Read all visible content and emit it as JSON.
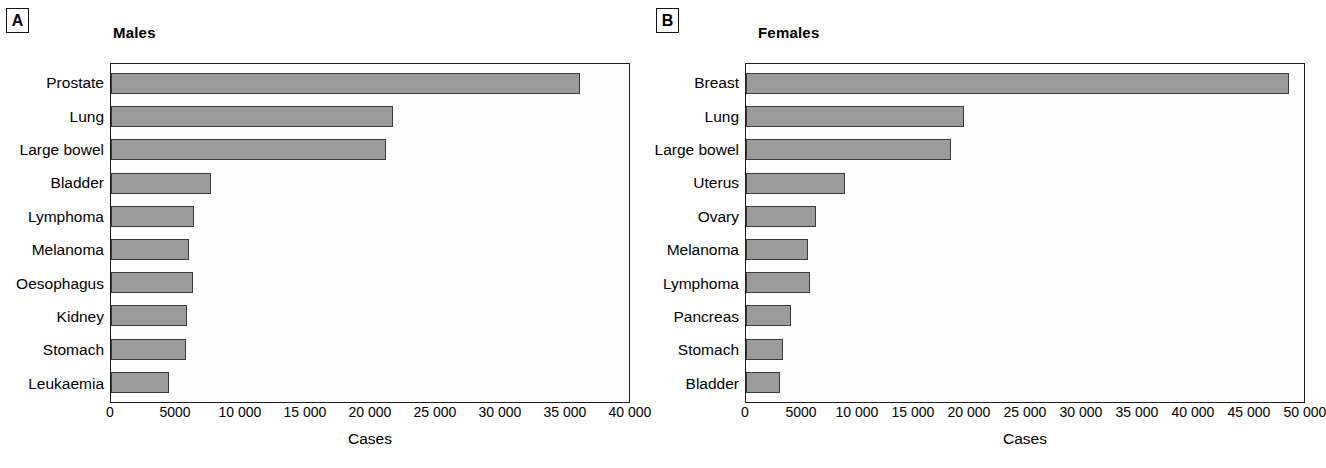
{
  "figure": {
    "panels": [
      {
        "letter": "A",
        "title": "Males",
        "xlabel": "Cases",
        "xticks": [
          "0",
          "5000",
          "10 000",
          "15 000",
          "20 000",
          "25 000",
          "30 000",
          "35 000",
          "40 000"
        ],
        "xmax": 40000
      },
      {
        "letter": "B",
        "title": "Females",
        "xlabel": "Cases",
        "xticks": [
          "0",
          "5000",
          "10 000",
          "15 000",
          "20 000",
          "25 000",
          "30 000",
          "35 000",
          "40 000",
          "45 000",
          "50 000"
        ],
        "xmax": 50000
      }
    ]
  },
  "colors": {
    "bar_fill": "#9b9b9b",
    "bar_stroke": "#3a3a3a",
    "axis": "#1a1a1a",
    "plot_background": "#fdfdfd",
    "text": "#000000"
  },
  "chart_data": [
    {
      "type": "bar",
      "orientation": "horizontal",
      "title": "Males",
      "panel": "A",
      "xlabel": "Cases",
      "ylabel": "",
      "xlim": [
        0,
        40000
      ],
      "xticks": [
        0,
        5000,
        10000,
        15000,
        20000,
        25000,
        30000,
        35000,
        40000
      ],
      "grid": false,
      "legend": "none",
      "categories": [
        "Prostate",
        "Lung",
        "Large bowel",
        "Bladder",
        "Lymphoma",
        "Melanoma",
        "Oesophagus",
        "Kidney",
        "Stomach",
        "Leukaemia"
      ],
      "values": [
        36200,
        21800,
        21200,
        7700,
        6400,
        6000,
        6300,
        5850,
        5800,
        4450
      ]
    },
    {
      "type": "bar",
      "orientation": "horizontal",
      "title": "Females",
      "panel": "B",
      "xlabel": "Cases",
      "ylabel": "",
      "xlim": [
        0,
        50000
      ],
      "xticks": [
        0,
        5000,
        10000,
        15000,
        20000,
        25000,
        30000,
        35000,
        40000,
        45000,
        50000
      ],
      "grid": false,
      "legend": "none",
      "categories": [
        "Breast",
        "Lung",
        "Large bowel",
        "Uterus",
        "Ovary",
        "Melanoma",
        "Lymphoma",
        "Pancreas",
        "Stomach",
        "Bladder"
      ],
      "values": [
        48700,
        19500,
        18400,
        8900,
        6250,
        5600,
        5700,
        4000,
        3300,
        3050
      ]
    }
  ]
}
